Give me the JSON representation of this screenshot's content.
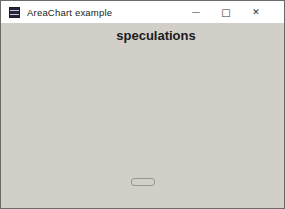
{
  "window": {
    "title": "AreaChart example",
    "controls": {
      "minimize": "—",
      "maximize": "□",
      "close": "✕"
    }
  },
  "chart_data": {
    "type": "area",
    "title": "speculations",
    "categories": [
      "2017",
      "2018",
      "2019",
      "2020",
      "2021",
      "2022",
      "2023",
      "2024",
      "2025",
      "2026"
    ],
    "series": [
      {
        "name": "java",
        "values": [
          15,
          16,
          17,
          18,
          19,
          22,
          25,
          27,
          29,
          31
        ],
        "fill": "#9c9c96",
        "line": "#72726c"
      },
      {
        "name": "C",
        "values": [
          6.5,
          5,
          4.5,
          4.5,
          5,
          4.5,
          4.5,
          5,
          6,
          6.5
        ],
        "fill": "#87877f",
        "line": "#5f5f58"
      },
      {
        "name": "C++",
        "values": [
          4.5,
          2.5,
          2.5,
          2,
          1.5,
          0.5,
          0,
          0,
          0.5,
          0
        ],
        "fill": "#44443e",
        "line": "#262622"
      }
    ],
    "ylim": [
      -5,
      35
    ],
    "yticks": [
      35,
      30,
      25,
      20,
      15,
      10,
      5,
      0,
      -5
    ],
    "ytick_step": 5,
    "grid": true,
    "legend_position": "bottom",
    "marker": "white-circle"
  },
  "colors": {
    "titlebar_bg": "#ffffff",
    "window_bg": "#d2cfc8",
    "plot_bg": "#dbd8d2",
    "plot_border": "#b9b6b0",
    "gridline": "#f0efeb",
    "axis": "#2e2e2e",
    "zero_line": "#1f1f1f",
    "text": "#1b1b1b",
    "marker_fill": "#ffffff",
    "marker_stroke": "#6b6b66"
  }
}
